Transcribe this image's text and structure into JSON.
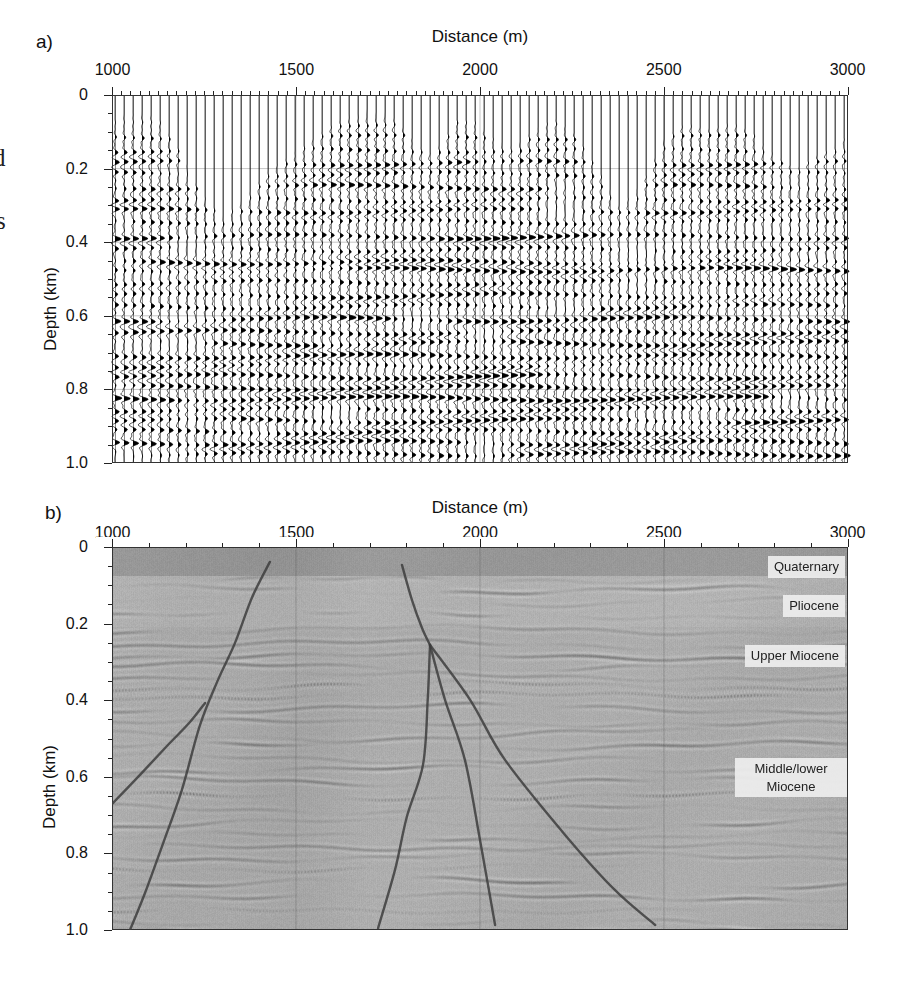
{
  "figure": {
    "panel_a": {
      "label": "a)",
      "title": "Distance (m)",
      "x_ticks": [
        "1000",
        "1500",
        "2000",
        "2500",
        "3000"
      ],
      "y_label": "Depth (km)",
      "y_ticks": [
        "0",
        "0.2",
        "0.4",
        "0.6",
        "0.8",
        "1.0"
      ]
    },
    "panel_b": {
      "label": "b)",
      "title": "Distance (m)",
      "x_ticks": [
        "1000",
        "1500",
        "2000",
        "2500",
        "3000"
      ],
      "y_label": "Depth (km)",
      "y_ticks": [
        "0",
        "0.2",
        "0.4",
        "0.6",
        "0.8",
        "1.0"
      ],
      "strata": [
        "Quaternary",
        "Pliocene",
        "Upper Miocene",
        "Middle/lower Miocene"
      ]
    },
    "margin_fragments": [
      "d",
      "s"
    ]
  },
  "chart_data": [
    {
      "type": "heatmap",
      "subtype": "seismic-wiggle-depth-section",
      "title": "Distance (m)",
      "xlabel": "Distance (m)",
      "ylabel": "Depth (km)",
      "x_range": [
        1000,
        3000
      ],
      "y_range": [
        0,
        1.0
      ],
      "x_major_tick_m": 500,
      "x_minor_tick_m": 25,
      "y_major_tick_km": 0.2,
      "y_minor_tick_km": 0.05,
      "trace_spacing_m": 25,
      "grid_vertical_m": [
        1500,
        2000,
        2500
      ],
      "grid_horizontal_km": [
        0.2,
        0.4,
        0.6,
        0.8
      ],
      "reflectors": [
        {
          "z": 0.08,
          "a": 0.5
        },
        {
          "z": 0.115,
          "a": 0.75
        },
        {
          "z": 0.15,
          "a": 0.6
        },
        {
          "z": 0.185,
          "a": 0.9
        },
        {
          "z": 0.215,
          "a": 0.7
        },
        {
          "z": 0.25,
          "a": 0.85
        },
        {
          "z": 0.285,
          "a": 0.6
        },
        {
          "z": 0.315,
          "a": 0.75
        },
        {
          "z": 0.345,
          "a": 0.5
        },
        {
          "z": 0.385,
          "a": 1.0
        },
        {
          "z": 0.42,
          "a": 0.55
        },
        {
          "z": 0.455,
          "a": 0.8
        },
        {
          "z": 0.475,
          "a": 0.95
        },
        {
          "z": 0.51,
          "a": 0.5
        },
        {
          "z": 0.545,
          "a": 0.65
        },
        {
          "z": 0.575,
          "a": 0.6
        },
        {
          "z": 0.61,
          "a": 0.95
        },
        {
          "z": 0.645,
          "a": 0.7
        },
        {
          "z": 0.675,
          "a": 0.8
        },
        {
          "z": 0.71,
          "a": 0.9
        },
        {
          "z": 0.735,
          "a": 0.6
        },
        {
          "z": 0.765,
          "a": 1.0
        },
        {
          "z": 0.795,
          "a": 0.85
        },
        {
          "z": 0.825,
          "a": 0.95
        },
        {
          "z": 0.855,
          "a": 0.6
        },
        {
          "z": 0.885,
          "a": 0.9
        },
        {
          "z": 0.915,
          "a": 0.65
        },
        {
          "z": 0.945,
          "a": 0.8
        },
        {
          "z": 0.975,
          "a": 0.9
        }
      ],
      "mute_boundary": [
        [
          1000,
          0.06
        ],
        [
          1060,
          0.04
        ],
        [
          1120,
          0.05
        ],
        [
          1180,
          0.14
        ],
        [
          1240,
          0.26
        ],
        [
          1300,
          0.33
        ],
        [
          1360,
          0.28
        ],
        [
          1430,
          0.2
        ],
        [
          1500,
          0.15
        ],
        [
          1570,
          0.1
        ],
        [
          1640,
          0.05
        ],
        [
          1700,
          0.035
        ],
        [
          1760,
          0.05
        ],
        [
          1820,
          0.12
        ],
        [
          1860,
          0.16
        ],
        [
          1900,
          0.12
        ],
        [
          1940,
          0.06
        ],
        [
          1990,
          0.07
        ],
        [
          2040,
          0.12
        ],
        [
          2090,
          0.14
        ],
        [
          2140,
          0.1
        ],
        [
          2200,
          0.06
        ],
        [
          2260,
          0.1
        ],
        [
          2320,
          0.2
        ],
        [
          2380,
          0.3
        ],
        [
          2440,
          0.24
        ],
        [
          2500,
          0.12
        ],
        [
          2560,
          0.07
        ],
        [
          2620,
          0.09
        ],
        [
          2680,
          0.07
        ],
        [
          2740,
          0.1
        ],
        [
          2800,
          0.16
        ],
        [
          2860,
          0.2
        ],
        [
          2920,
          0.16
        ],
        [
          3000,
          0.11
        ]
      ]
    },
    {
      "type": "heatmap",
      "subtype": "migrated-seismic-depth-section",
      "title": "Distance (m)",
      "xlabel": "Distance (m)",
      "ylabel": "Depth (km)",
      "x_range": [
        1000,
        3000
      ],
      "y_range": [
        0,
        1.0
      ],
      "x_major_tick_m": 500,
      "x_minor_tick_m": 100,
      "y_major_tick_km": 0.2,
      "y_minor_tick_km": 0.05,
      "grid_vertical_m": [
        1500,
        2000,
        2500
      ],
      "zones": [
        {
          "name": "Quaternary",
          "base_depth_km": 0.075
        },
        {
          "name": "Pliocene",
          "base_depth_km": 0.21
        },
        {
          "name": "Upper Miocene",
          "base_depth_km": 0.45
        },
        {
          "name": "Middle/lower Miocene",
          "base_depth_km": 1.0
        }
      ],
      "reflector_gen": {
        "z_start": 0.085,
        "z_end": 1.02,
        "dz_min": 0.024,
        "dz_jitter": 0.016,
        "seed": 7
      },
      "faults": [
        {
          "name": "left-main-fault",
          "points_m_km": [
            [
              1429,
              0.039
            ],
            [
              1380,
              0.133
            ],
            [
              1334,
              0.251
            ],
            [
              1288,
              0.347
            ],
            [
              1239,
              0.465
            ],
            [
              1190,
              0.634
            ],
            [
              1139,
              0.773
            ],
            [
              1090,
              0.903
            ],
            [
              1049,
              1.0
            ]
          ]
        },
        {
          "name": "left-branch-fault",
          "points_m_km": [
            [
              1253,
              0.407
            ],
            [
              1212,
              0.457
            ],
            [
              1152,
              0.517
            ],
            [
              1076,
              0.595
            ],
            [
              995,
              0.676
            ]
          ]
        },
        {
          "name": "central-fault-stem",
          "points_m_km": [
            [
              1788,
              0.047
            ],
            [
              1815,
              0.138
            ],
            [
              1842,
              0.211
            ],
            [
              1864,
              0.256
            ]
          ]
        },
        {
          "name": "central-branch-1",
          "points_m_km": [
            [
              1864,
              0.256
            ],
            [
              1858,
              0.399
            ],
            [
              1845,
              0.569
            ],
            [
              1801,
              0.705
            ],
            [
              1769,
              0.843
            ],
            [
              1723,
              0.995
            ]
          ]
        },
        {
          "name": "central-branch-2",
          "points_m_km": [
            [
              1864,
              0.256
            ],
            [
              1905,
              0.399
            ],
            [
              1959,
              0.556
            ],
            [
              2000,
              0.765
            ],
            [
              2041,
              0.987
            ]
          ]
        },
        {
          "name": "central-branch-3",
          "points_m_km": [
            [
              1864,
              0.256
            ],
            [
              1973,
              0.399
            ],
            [
              2068,
              0.556
            ],
            [
              2236,
              0.757
            ],
            [
              2367,
              0.896
            ],
            [
              2476,
              0.987
            ]
          ]
        }
      ],
      "colors": {
        "background": "#a9a9a9",
        "quaternary_band": "#979797",
        "fault": "#3d3d3d",
        "label_box": "#eeeeee"
      }
    }
  ]
}
